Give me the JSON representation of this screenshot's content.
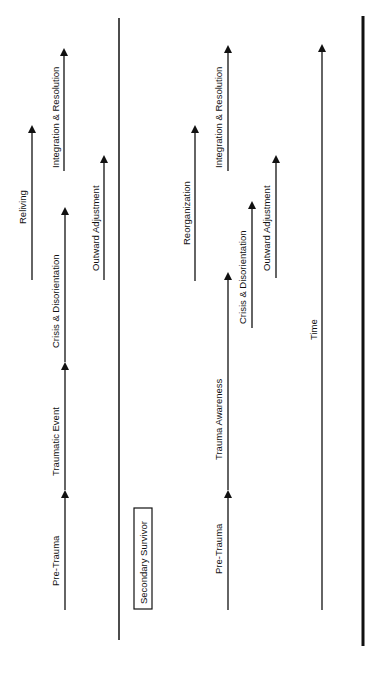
{
  "diagram": {
    "orientation": "rotated-90-ccw",
    "colors": {
      "ink": "#111111",
      "background": "#ffffff"
    },
    "primary_survivor": {
      "timeline": [
        {
          "label": "Pre-Trauma"
        },
        {
          "label": "Traumatic Event"
        },
        {
          "label": "Crisis & Disorientation"
        }
      ],
      "branches": [
        {
          "label": "Reliving"
        },
        {
          "label": "Integration & Resolution"
        },
        {
          "label": "Outward Adjustment"
        }
      ]
    },
    "secondary_survivor": {
      "title": "Secondary Survivor",
      "timeline": [
        {
          "label": "Pre-Trauma"
        },
        {
          "label": "Trauma Awareness"
        }
      ],
      "branches": [
        {
          "label": "Reorganization"
        },
        {
          "label": "Integration & Resolution"
        },
        {
          "label": "Crisis & Disorientation"
        },
        {
          "label": "Outward Adjustment"
        }
      ]
    },
    "time_axis": {
      "label": "Time"
    }
  }
}
